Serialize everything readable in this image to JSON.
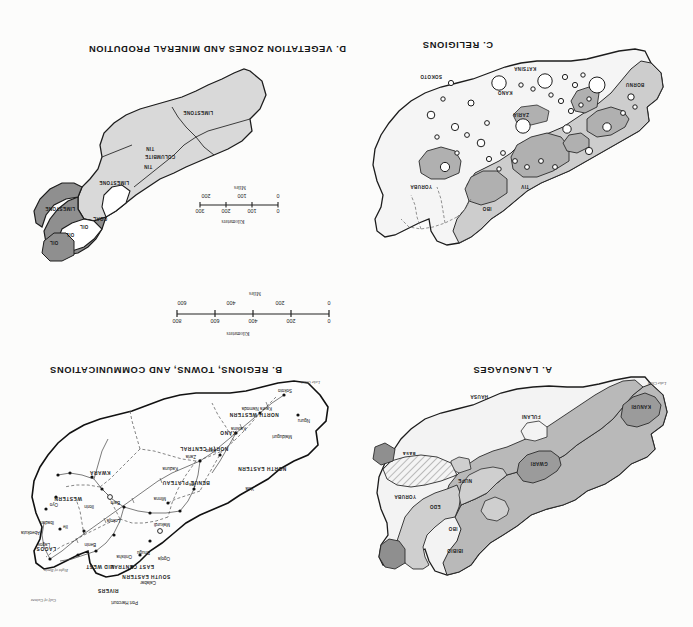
{
  "plate": {
    "orientation_degrees": 180,
    "background_color": "#fbfbfa",
    "panels": [
      {
        "id": "A",
        "title": "A. LANGUAGES"
      },
      {
        "id": "B",
        "title": "B. REGIONS, TOWNS, AND COMMUNICATIONS"
      },
      {
        "id": "C",
        "title": "C. RELIGIONS"
      },
      {
        "id": "D",
        "title": "D. VEGETATION ZONES AND MINERAL PRODUTION"
      }
    ]
  },
  "panel_a": {
    "title": "A. LANGUAGES",
    "labels": [
      {
        "text": "IBIBIO"
      },
      {
        "text": "IBO"
      },
      {
        "text": "EDO"
      },
      {
        "text": "YORUBA"
      },
      {
        "text": "NUPE"
      },
      {
        "text": "GWARI"
      },
      {
        "text": "KANURI"
      },
      {
        "text": "FULANI"
      },
      {
        "text": "HAUSA"
      },
      {
        "text": "BASA"
      }
    ],
    "water_label": "Lake Chad",
    "fills": {
      "light": "#f2f2f2",
      "mid_light": "#cfcfcf",
      "mid": "#b9b9b9",
      "dark": "#9a9a9a",
      "hatch": "#e8e8e8",
      "outline": "#1c1c1c"
    }
  },
  "panel_b": {
    "title": "B. REGIONS, TOWNS, AND COMMUNICATIONS",
    "regions": [
      "NORTH WESTERN",
      "NORTH CENTRAL",
      "KANO",
      "NORTH EASTERN",
      "BENUE PLATEAU",
      "KWARA",
      "WESTERN",
      "LAGOS",
      "MID WEST",
      "EAST CENTRAL",
      "SOUTH EASTERN",
      "RIVERS"
    ],
    "towns": [
      "Sokoto",
      "Kaura Namoda",
      "Katsina",
      "Kano",
      "Nguru",
      "Maiduguri",
      "Yola",
      "Zaria",
      "Kaduna",
      "Jos",
      "Minna",
      "Baro",
      "Ilorin",
      "Oyo",
      "Ibadan",
      "Ife",
      "Abeokuta",
      "Lagos",
      "Benin",
      "Lokoja",
      "Makurdi",
      "Onitsha",
      "Enugu",
      "Ogoja",
      "Calabar",
      "Port Harcourt"
    ],
    "water_labels": [
      "Lake Chad",
      "Gulf of Guinea",
      "Bight of Benin"
    ],
    "fills": {
      "land": "#fdfdfd",
      "outline": "#111111",
      "internal_border": "#555555"
    }
  },
  "panel_c": {
    "title": "C. RELIGIONS",
    "labels": [
      "IBO",
      "TIV",
      "YORUBA",
      "ZARIA",
      "KANO",
      "BORNU",
      "KATSINA",
      "SOKOTO"
    ],
    "fills": {
      "christian_light": "#f5f5f5",
      "muslim_mid": "#cdcdcd",
      "muslim_dark": "#b0b0b0",
      "circle": "#ffffff",
      "outline": "#1c1c1c"
    },
    "symbol_note": "white circles sized by population of muslim centres"
  },
  "panel_d": {
    "title": "D. VEGETATION ZONES AND MINERAL PRODUTION",
    "labels": [
      "OIL",
      "OIL",
      "OIL",
      "COAL",
      "LIMESTONE",
      "LIMESTONE",
      "LIMESTONE",
      "TIN",
      "COLUMBITE",
      "TIN"
    ],
    "fills": {
      "savanna": "#d9d9d9",
      "forest": "#8f8f8f",
      "clear": "#ffffff",
      "outline": "#1c1c1c"
    }
  },
  "scale_center": {
    "kilometers_caption": "Kilometers",
    "kilometers_ticks": [
      "0",
      "200",
      "400",
      "600",
      "800"
    ],
    "miles_caption": "Miles",
    "miles_ticks": [
      "0",
      "200",
      "400",
      "600"
    ]
  },
  "scale_panel_d": {
    "kilometers_caption": "Kilometers",
    "kilometers_ticks": [
      "0",
      "100",
      "200",
      "300"
    ],
    "miles_caption": "Miles",
    "miles_ticks": [
      "0",
      "100",
      "200"
    ]
  }
}
